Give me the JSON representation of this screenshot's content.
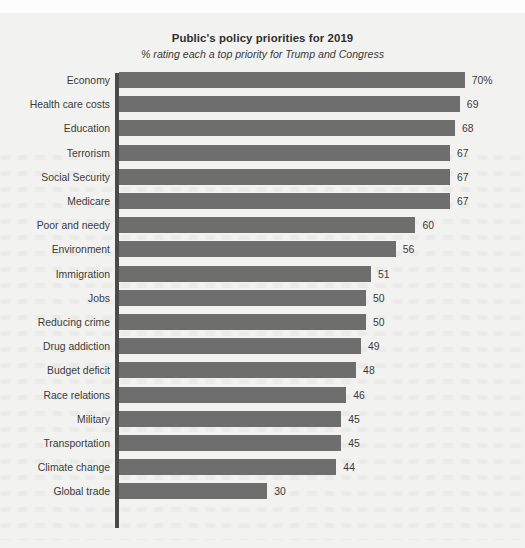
{
  "chart_data": {
    "type": "bar",
    "orientation": "horizontal",
    "title": "Public's policy priorities for 2019",
    "subtitle": "% rating each a top priority for Trump and Congress",
    "xlabel": "",
    "ylabel": "",
    "xlim": [
      0,
      70
    ],
    "grid": false,
    "legend": null,
    "value_suffix_first": "%",
    "categories": [
      "Economy",
      "Health care costs",
      "Education",
      "Terrorism",
      "Social Security",
      "Medicare",
      "Poor and needy",
      "Environment",
      "Immigration",
      "Jobs",
      "Reducing crime",
      "Drug addiction",
      "Budget deficit",
      "Race relations",
      "Military",
      "Transportation",
      "Climate change",
      "Global trade"
    ],
    "values": [
      70,
      69,
      68,
      67,
      67,
      67,
      60,
      56,
      51,
      50,
      50,
      49,
      48,
      46,
      45,
      45,
      44,
      30
    ],
    "value_labels": [
      "70%",
      "69",
      "68",
      "67",
      "67",
      "67",
      "60",
      "56",
      "51",
      "50",
      "50",
      "49",
      "48",
      "46",
      "45",
      "45",
      "44",
      "30"
    ],
    "colors": {
      "bar": "#6e6e6e",
      "axis": "#4a4a4a",
      "text": "#3b3b3b",
      "title": "#2f2f2f",
      "background": "#f2f2f0"
    }
  }
}
